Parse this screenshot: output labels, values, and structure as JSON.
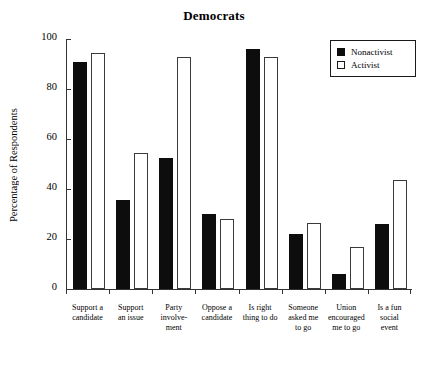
{
  "chart_data": {
    "type": "bar",
    "title": "Democrats",
    "xlabel": "",
    "ylabel": "Percentage of Respondents",
    "ylim": [
      0,
      100
    ],
    "yticks": [
      0,
      20,
      40,
      60,
      80,
      100
    ],
    "grid": false,
    "legend_position": "top-right",
    "categories": [
      "Support a\ncandidate",
      "Support\nan issue",
      "Party\ninvolve-\nment",
      "Oppose a\ncandidate",
      "Is right\nthing to do",
      "Someone\nasked me\nto go",
      "Union\nencouraged\nme to go",
      "Is a fun\nsocial\nevent"
    ],
    "series": [
      {
        "name": "Nonactivist",
        "color": "#0d0d0d",
        "values": [
          91,
          35.5,
          52.5,
          30,
          96,
          22,
          6,
          26
        ]
      },
      {
        "name": "Activist",
        "color": "#ffffff",
        "values": [
          94.5,
          54.5,
          93,
          28,
          93,
          26.5,
          17,
          43.5
        ]
      }
    ]
  },
  "legend": {
    "items": [
      {
        "label": "Nonactivist",
        "swatch": "filled"
      },
      {
        "label": "Activist",
        "swatch": "hollow"
      }
    ]
  }
}
